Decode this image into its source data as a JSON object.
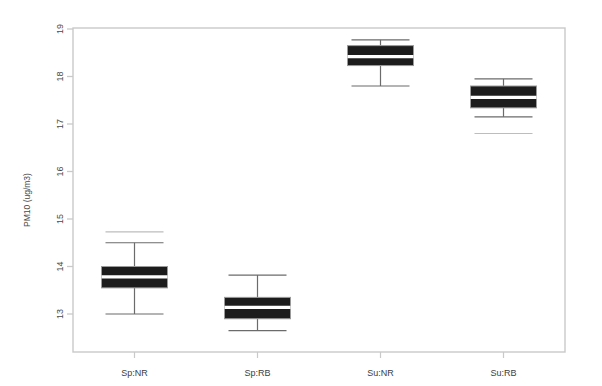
{
  "chart_data": {
    "type": "box",
    "title": "",
    "xlabel": "",
    "ylabel": "PM10 (ug/m3)",
    "categories": [
      "Sp:NR",
      "Sp:RB",
      "Su:NR",
      "Su:RB"
    ],
    "ylim": [
      12.4,
      19.15
    ],
    "yticks": [
      13,
      14,
      15,
      16,
      17,
      18,
      19
    ],
    "ytick_labels": [
      "13",
      "14",
      "15",
      "16",
      "17",
      "18",
      "19"
    ],
    "grid": false,
    "legend": "none",
    "box_fill_color": "#1c1c1c",
    "median_color": "#ffffff",
    "line_color": "#6b6b6b",
    "frame_color": "#c9c9c9",
    "boxes": [
      {
        "label": "Sp:NR",
        "whisker_low": 13.0,
        "q1": 13.55,
        "median": 13.78,
        "q3": 14.0,
        "whisker_high": 14.5,
        "outliers": [
          14.73
        ]
      },
      {
        "label": "Sp:RB",
        "whisker_low": 12.65,
        "q1": 12.9,
        "median": 13.14,
        "q3": 13.35,
        "whisker_high": 13.82,
        "outliers": []
      },
      {
        "label": "Su:NR",
        "whisker_low": 17.8,
        "q1": 18.23,
        "median": 18.42,
        "q3": 18.65,
        "whisker_high": 18.77,
        "outliers": []
      },
      {
        "label": "Su:RB",
        "whisker_low": 17.15,
        "q1": 17.34,
        "median": 17.56,
        "q3": 17.8,
        "whisker_high": 17.95,
        "outliers": [
          16.8
        ]
      }
    ]
  }
}
